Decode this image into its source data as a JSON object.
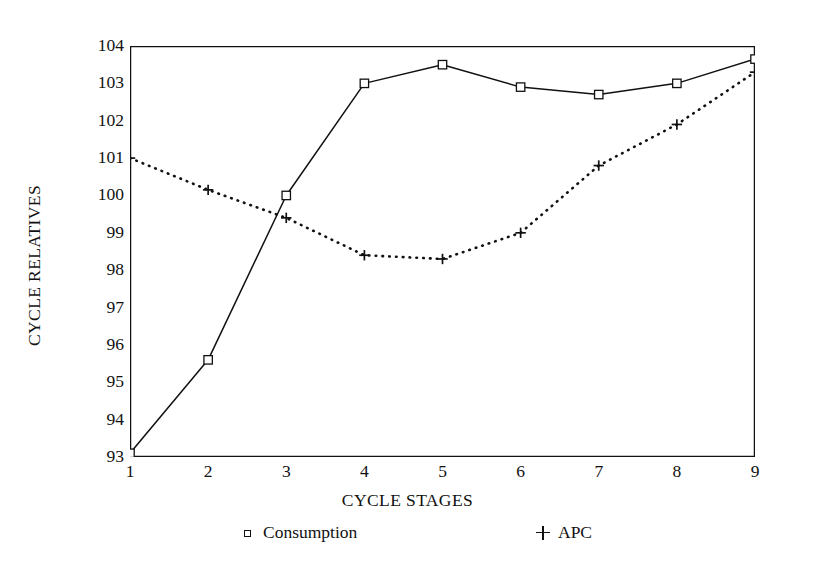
{
  "chart_data": {
    "type": "line",
    "title": "",
    "xlabel": "CYCLE STAGES",
    "ylabel": "CYCLE RELATIVES",
    "categories": [
      "1",
      "2",
      "3",
      "4",
      "5",
      "6",
      "7",
      "8",
      "9"
    ],
    "x": [
      1,
      2,
      3,
      4,
      5,
      6,
      7,
      8,
      9
    ],
    "xlim": [
      1,
      9
    ],
    "ylim": [
      93,
      104
    ],
    "y_ticks": [
      93,
      94,
      95,
      96,
      97,
      98,
      99,
      100,
      101,
      102,
      103,
      104
    ],
    "x_ticks": [
      1,
      2,
      3,
      4,
      5,
      6,
      7,
      8,
      9
    ],
    "grid": false,
    "legend_position": "bottom",
    "series": [
      {
        "name": "Consumption",
        "marker": "open-square",
        "line_style": "solid",
        "color": "#111111",
        "values": [
          93.1,
          95.6,
          100.0,
          103.0,
          103.5,
          102.9,
          102.7,
          103.0,
          103.65
        ]
      },
      {
        "name": "APC",
        "marker": "plus",
        "line_style": "dotted",
        "color": "#111111",
        "values": [
          101.0,
          100.15,
          99.4,
          98.4,
          98.3,
          99.0,
          100.8,
          101.9,
          103.3
        ]
      }
    ]
  },
  "legend": {
    "items": [
      {
        "label": "Consumption",
        "marker": "square-marker"
      },
      {
        "label": "APC",
        "marker": "plus-marker"
      }
    ]
  }
}
